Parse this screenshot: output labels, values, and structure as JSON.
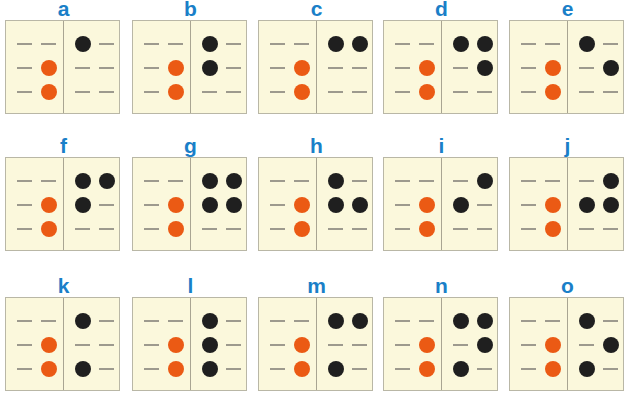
{
  "title": "",
  "colors": {
    "label": "#1a7fc8",
    "card_bg": "#fbf8dc",
    "orange_dot": "#eb5a14",
    "black_dot": "#1f1f1f",
    "dash": "#9d9a8e"
  },
  "left_pattern": [
    [
      0,
      0
    ],
    [
      0,
      1
    ],
    [
      0,
      1
    ]
  ],
  "cards": [
    {
      "label": "a",
      "x": 5,
      "y": 20,
      "right": [
        [
          1,
          0
        ],
        [
          0,
          0
        ],
        [
          0,
          0
        ]
      ]
    },
    {
      "label": "b",
      "x": 132,
      "y": 20,
      "right": [
        [
          1,
          0
        ],
        [
          1,
          0
        ],
        [
          0,
          0
        ]
      ]
    },
    {
      "label": "c",
      "x": 258,
      "y": 20,
      "right": [
        [
          1,
          1
        ],
        [
          0,
          0
        ],
        [
          0,
          0
        ]
      ]
    },
    {
      "label": "d",
      "x": 383,
      "y": 20,
      "right": [
        [
          1,
          1
        ],
        [
          0,
          1
        ],
        [
          0,
          0
        ]
      ]
    },
    {
      "label": "e",
      "x": 509,
      "y": 20,
      "right": [
        [
          1,
          0
        ],
        [
          0,
          1
        ],
        [
          0,
          0
        ]
      ]
    },
    {
      "label": "f",
      "x": 5,
      "y": 157,
      "right": [
        [
          1,
          1
        ],
        [
          1,
          0
        ],
        [
          0,
          0
        ]
      ]
    },
    {
      "label": "g",
      "x": 132,
      "y": 157,
      "right": [
        [
          1,
          1
        ],
        [
          1,
          1
        ],
        [
          0,
          0
        ]
      ]
    },
    {
      "label": "h",
      "x": 258,
      "y": 157,
      "right": [
        [
          1,
          0
        ],
        [
          1,
          1
        ],
        [
          0,
          0
        ]
      ]
    },
    {
      "label": "i",
      "x": 383,
      "y": 157,
      "right": [
        [
          0,
          1
        ],
        [
          1,
          0
        ],
        [
          0,
          0
        ]
      ]
    },
    {
      "label": "j",
      "x": 509,
      "y": 157,
      "right": [
        [
          0,
          1
        ],
        [
          1,
          1
        ],
        [
          0,
          0
        ]
      ]
    },
    {
      "label": "k",
      "x": 5,
      "y": 297,
      "right": [
        [
          1,
          0
        ],
        [
          0,
          0
        ],
        [
          1,
          0
        ]
      ]
    },
    {
      "label": "l",
      "x": 132,
      "y": 297,
      "right": [
        [
          1,
          0
        ],
        [
          1,
          0
        ],
        [
          1,
          0
        ]
      ]
    },
    {
      "label": "m",
      "x": 258,
      "y": 297,
      "right": [
        [
          1,
          1
        ],
        [
          0,
          0
        ],
        [
          1,
          0
        ]
      ]
    },
    {
      "label": "n",
      "x": 383,
      "y": 297,
      "right": [
        [
          1,
          1
        ],
        [
          0,
          1
        ],
        [
          1,
          0
        ]
      ]
    },
    {
      "label": "o",
      "x": 509,
      "y": 297,
      "right": [
        [
          1,
          0
        ],
        [
          0,
          1
        ],
        [
          1,
          0
        ]
      ]
    }
  ]
}
